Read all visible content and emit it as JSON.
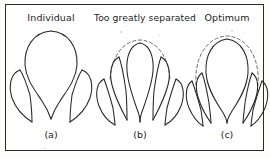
{
  "figure": {
    "background_color": "#ffffff",
    "line_color": "#262626",
    "dashed_color": "#6d6d6d",
    "border_color": "#2b2b2b"
  },
  "panels": [
    {
      "id": "a",
      "title": "Individual",
      "caption": "(a)",
      "description": "Single plant canopy with one tall central lobe and two short side lobes, drawn in solid line only",
      "has_dashed_outline": false,
      "lobe_count": 3
    },
    {
      "id": "b",
      "title": "Too greatly separated",
      "caption": "(b)",
      "description": "Canopy lobes spread widely apart with a broad flat dashed envelope arching over the gaps",
      "has_dashed_outline": true,
      "lobe_count": 5
    },
    {
      "id": "c",
      "title": "Optimum",
      "caption": "(c)",
      "description": "Canopy lobes closely grouped beneath a tall narrow dashed envelope that hugs the outline",
      "has_dashed_outline": true,
      "lobe_count": 5
    }
  ]
}
